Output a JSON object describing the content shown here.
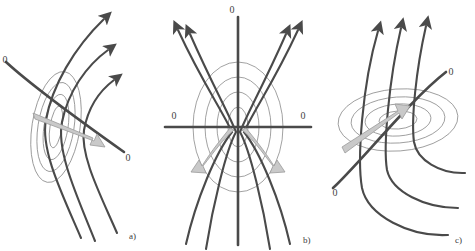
{
  "figure": {
    "title": "",
    "background_color": "#ffffff",
    "panels": [
      {
        "id": "a",
        "label": "a)",
        "description": "tilted-narrow-ellipses-with-diagonal-separatrix",
        "zero_labels": [
          "0",
          "0"
        ],
        "field_line_count": 3,
        "shaded_arrow_direction": "down-right",
        "ellipse_count": 4
      },
      {
        "id": "b",
        "label": "b)",
        "description": "symmetric-cross-axes-with-concentric-ellipses",
        "zero_labels": [
          "0",
          "0",
          "0"
        ],
        "field_line_count": 4,
        "shaded_arrow_direction": "down-left-and-down-right",
        "ellipse_count": 4
      },
      {
        "id": "c",
        "label": "c)",
        "description": "horizontal-ellipses-with-diagonal-separatrix",
        "zero_labels": [
          "0",
          "0"
        ],
        "field_line_count": 3,
        "shaded_arrow_direction": "up-right",
        "ellipse_count": 4
      }
    ],
    "colors": {
      "field_line": "#4a4a4a",
      "ellipse": "#8a8a8a",
      "axis": "#4a4a4a",
      "shaded_arrow_fill": "#c9c9c9",
      "shaded_arrow_stroke": "#9a9a9a",
      "text": "#3f3f3f"
    },
    "zero": "0"
  }
}
